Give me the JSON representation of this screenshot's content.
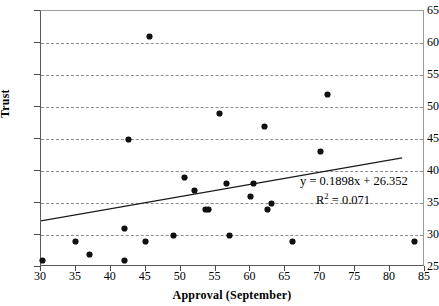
{
  "chart_data": {
    "type": "scatter",
    "title": "",
    "xlabel": "Approval (September)",
    "ylabel": "Trust",
    "xlim": [
      30,
      85
    ],
    "ylim": [
      25,
      65
    ],
    "xticks": [
      30,
      35,
      40,
      45,
      50,
      55,
      60,
      65,
      70,
      75,
      80,
      85
    ],
    "yticks": [
      25,
      30,
      35,
      40,
      45,
      50,
      55,
      60,
      65
    ],
    "grid": "horizontal-dashed",
    "legend": "none",
    "points": [
      {
        "x": 30.2,
        "y": 26
      },
      {
        "x": 35.0,
        "y": 29
      },
      {
        "x": 37.0,
        "y": 27
      },
      {
        "x": 42.0,
        "y": 26
      },
      {
        "x": 42.0,
        "y": 31
      },
      {
        "x": 42.5,
        "y": 45
      },
      {
        "x": 45.0,
        "y": 29
      },
      {
        "x": 45.5,
        "y": 61
      },
      {
        "x": 49.0,
        "y": 30
      },
      {
        "x": 50.5,
        "y": 39
      },
      {
        "x": 52.0,
        "y": 37
      },
      {
        "x": 53.5,
        "y": 34
      },
      {
        "x": 54.0,
        "y": 34
      },
      {
        "x": 55.5,
        "y": 49
      },
      {
        "x": 56.5,
        "y": 38
      },
      {
        "x": 57.0,
        "y": 30
      },
      {
        "x": 60.0,
        "y": 36
      },
      {
        "x": 60.5,
        "y": 38
      },
      {
        "x": 62.0,
        "y": 47
      },
      {
        "x": 62.5,
        "y": 34
      },
      {
        "x": 63.0,
        "y": 35
      },
      {
        "x": 66.0,
        "y": 29
      },
      {
        "x": 70.0,
        "y": 43
      },
      {
        "x": 71.0,
        "y": 52
      },
      {
        "x": 83.5,
        "y": 29
      }
    ],
    "trendline": {
      "slope": 0.1898,
      "intercept": 26.352,
      "r_squared": 0.071,
      "x_start": 30,
      "x_end": 82,
      "equation_label": "y = 0.1898x + 26.352",
      "r2_label_prefix": "R",
      "r2_label_sup": "2",
      "r2_label_value": " = 0.071"
    },
    "colors": {
      "point": "#111111",
      "trendline": "#1a1a1a",
      "gridline": "#8d8d8d",
      "axis": "#4a4a4a",
      "background": "#ffffff"
    }
  }
}
